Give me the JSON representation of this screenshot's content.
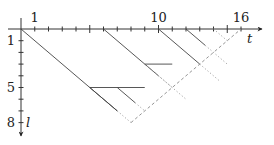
{
  "diagram": {
    "type": "space-time lattice diagram",
    "axes": {
      "horizontal": {
        "label": "t",
        "tick_labels": [
          {
            "value": 1,
            "text": "1"
          },
          {
            "value": 10,
            "text": "10"
          },
          {
            "value": 16,
            "text": "16"
          }
        ],
        "range": [
          0,
          16
        ],
        "ticks_every": 1
      },
      "vertical": {
        "label": "l",
        "tick_labels": [
          {
            "value": 1,
            "text": "1"
          },
          {
            "value": 5,
            "text": "5"
          },
          {
            "value": 8,
            "text": "8"
          }
        ],
        "range": [
          0,
          8
        ],
        "ticks_every": 1,
        "direction": "down"
      }
    },
    "solid_diagonals": [
      {
        "from": [
          0,
          0
        ],
        "to": [
          7,
          7
        ]
      },
      {
        "from": [
          6,
          0
        ],
        "to": [
          10,
          4
        ]
      },
      {
        "from": [
          10,
          0
        ],
        "to": [
          13,
          3
        ]
      },
      {
        "from": [
          12,
          0
        ],
        "to": [
          13.4,
          1.4
        ]
      },
      {
        "from": [
          5,
          5
        ],
        "to": [
          7,
          7
        ]
      },
      {
        "from": [
          7,
          5
        ],
        "to": [
          8.3,
          6.3
        ]
      }
    ],
    "dotted_diagonals": [
      {
        "from": [
          7,
          7
        ],
        "to": [
          8,
          8
        ]
      },
      {
        "from": [
          10,
          4
        ],
        "to": [
          12,
          6
        ]
      },
      {
        "from": [
          13,
          3
        ],
        "to": [
          14.5,
          4.5
        ]
      },
      {
        "from": [
          13.4,
          1.4
        ],
        "to": [
          15,
          3
        ]
      },
      {
        "from": [
          14,
          0
        ],
        "to": [
          15,
          1
        ]
      },
      {
        "from": [
          8.3,
          6.3
        ],
        "to": [
          9,
          7
        ]
      },
      {
        "from": [
          9,
          3
        ],
        "to": [
          11,
          5
        ]
      }
    ],
    "horizontal_segments": [
      {
        "l": 5,
        "from_t": 5,
        "to_t": 9
      },
      {
        "l": 3,
        "from_t": 9,
        "to_t": 11
      }
    ],
    "dashed_boundary": {
      "from": [
        8,
        8
      ],
      "to": [
        16,
        0
      ]
    }
  }
}
